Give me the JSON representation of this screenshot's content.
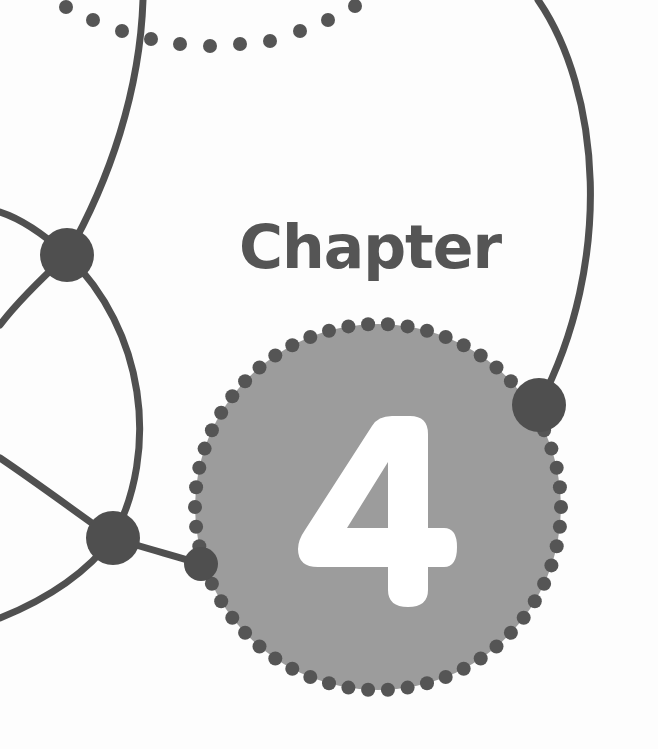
{
  "page": {
    "title_label": "Chapter",
    "chapter_number": "4"
  },
  "colors": {
    "background": "#fdfdfd",
    "ink": "#505050",
    "badge_fill": "#9c9c9c",
    "number_fill": "#ffffff",
    "label_color": "#555555"
  },
  "decorations": {
    "badge": {
      "cx": 378,
      "cy": 507,
      "r": 183,
      "dot_count": 58,
      "dot_r": 7
    },
    "nodes": [
      {
        "name": "node-upper-left",
        "cx": 67,
        "cy": 255,
        "r": 27
      },
      {
        "name": "node-lower-left",
        "cx": 113,
        "cy": 538,
        "r": 27
      },
      {
        "name": "node-badge-left",
        "cx": 201,
        "cy": 564,
        "r": 17
      },
      {
        "name": "node-badge-right",
        "cx": 539,
        "cy": 405,
        "r": 27
      }
    ],
    "top_arc_dots": [
      [
        66,
        7
      ],
      [
        93,
        20
      ],
      [
        122,
        31
      ],
      [
        151,
        39
      ],
      [
        180,
        44
      ],
      [
        210,
        46
      ],
      [
        240,
        44
      ],
      [
        270,
        41
      ],
      [
        300,
        31
      ],
      [
        328,
        20
      ],
      [
        355,
        6
      ]
    ]
  }
}
